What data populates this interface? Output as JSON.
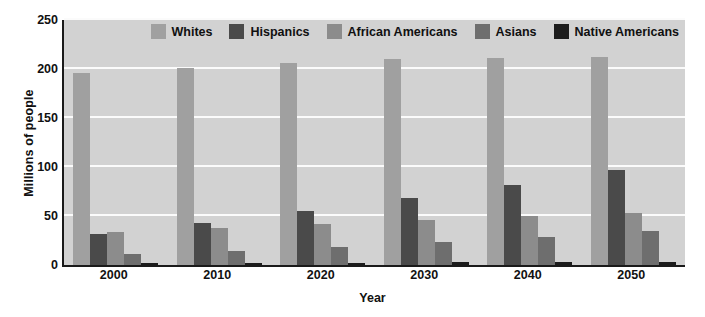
{
  "chart_data": {
    "type": "bar",
    "title": "",
    "xlabel": "Year",
    "ylabel": "Millions of people",
    "categories": [
      "2000",
      "2010",
      "2020",
      "2030",
      "2040",
      "2050"
    ],
    "ylim": [
      0,
      250
    ],
    "yticks": [
      0,
      50,
      100,
      150,
      200,
      250
    ],
    "grid": true,
    "legend_position": "top-right",
    "plot_background": "#d2d2d2",
    "gridline_color": "#fbfbfb",
    "axis_color": "#1a1a1a",
    "series": [
      {
        "name": "Whites",
        "color": "#a0a0a0",
        "values": [
          196,
          201,
          206,
          210,
          211,
          212
        ]
      },
      {
        "name": "Hispanics",
        "color": "#4a4a4a",
        "values": [
          32,
          43,
          55,
          68,
          82,
          97
        ]
      },
      {
        "name": "African Americans",
        "color": "#8c8c8c",
        "values": [
          34,
          38,
          42,
          46,
          50,
          53
        ]
      },
      {
        "name": "Asians",
        "color": "#6e6e6e",
        "values": [
          11,
          14,
          18,
          23,
          29,
          35
        ]
      },
      {
        "name": "Native Americans",
        "color": "#1c1c1c",
        "values": [
          2,
          2,
          2,
          3,
          3,
          3
        ]
      }
    ]
  }
}
